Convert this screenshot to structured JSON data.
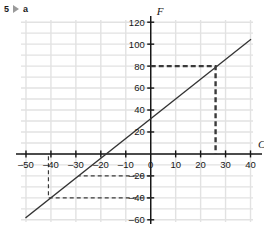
{
  "header": {
    "question_number": "5",
    "marker_icon": "play-triangle-icon",
    "part_label": "a"
  },
  "chart_data": {
    "type": "line",
    "title": "",
    "subtitle": "",
    "xlabel": "C",
    "ylabel": "F",
    "xlim": [
      -52,
      41
    ],
    "ylim": [
      -62,
      122
    ],
    "grid": true,
    "grid_step_x": 10,
    "grid_step_y": 10,
    "legend": "none",
    "xticks": [
      -50,
      -40,
      -30,
      -20,
      -10,
      0,
      10,
      20,
      30,
      40
    ],
    "xtick_labels": [
      "–50",
      "–40",
      "–30",
      "–20",
      "–10",
      "0",
      "10",
      "20",
      "30",
      "40"
    ],
    "yticks": [
      -60,
      -40,
      -20,
      20,
      40,
      60,
      80,
      100,
      120
    ],
    "ytick_labels": [
      "–60",
      "–40",
      "–20",
      "20",
      "40",
      "60",
      "80",
      "100",
      "120"
    ],
    "series": [
      {
        "name": "F = 1.8C + 32",
        "type": "line",
        "slope": 1.8,
        "intercept": 32,
        "x": [
          -50,
          40
        ],
        "y": [
          -58,
          104
        ],
        "color": "#333333"
      }
    ],
    "annotations": [
      {
        "name": "read-off-80F",
        "style": "dashed-thick",
        "color": "#3a3a3a",
        "points": [
          [
            0,
            80
          ],
          [
            26,
            80
          ],
          [
            26,
            0
          ]
        ],
        "from_value": 80,
        "from_axis": "F",
        "to_value": 26,
        "to_axis": "C"
      },
      {
        "name": "read-off-minus20F",
        "style": "dashed",
        "color": "#3a3a3a",
        "points": [
          [
            0,
            -20
          ],
          [
            -29,
            -20
          ]
        ],
        "from_value": -20,
        "from_axis": "F",
        "to_value": -29,
        "to_axis": "C"
      },
      {
        "name": "read-off-minus40F",
        "style": "dashed",
        "color": "#3a3a3a",
        "points": [
          [
            0,
            -40
          ],
          [
            -41,
            -40
          ],
          [
            -41,
            0
          ]
        ],
        "from_value": -40,
        "from_axis": "F",
        "to_value": -41,
        "to_axis": "C"
      }
    ],
    "colors": {
      "grid": "#e2e2e2",
      "axis": "#161616",
      "line": "#333333",
      "dash": "#3a3a3a"
    }
  }
}
